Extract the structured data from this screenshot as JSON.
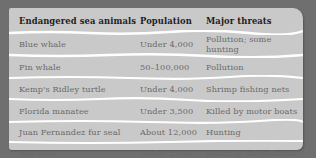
{
  "table": {
    "headers": [
      "Endangered sea animals",
      "Population",
      "Major threats"
    ],
    "rows": [
      [
        "Blue whale",
        "Under 4,000",
        "Pollution; some hunting"
      ],
      [
        "Fin whale",
        "50–100,000",
        "Pollution"
      ],
      [
        "Kemp's Ridley turtle",
        "Under 4,000",
        "Shrimp fishing nets"
      ],
      [
        "Florida manatee",
        "Under 3,500",
        "Killed by motor boats"
      ],
      [
        "Juan Fernandez fur seal",
        "About 12,000",
        "Hunting"
      ],
      [
        "Sea otter",
        "Under 2,500",
        "Hunting; oil pollution"
      ]
    ]
  },
  "colors": {
    "background": "#6f6f6f",
    "card": "#c9c9c9",
    "separator": "#ffffff",
    "header_text": "#1e1e1e",
    "body_text": "#6a6a6a"
  }
}
